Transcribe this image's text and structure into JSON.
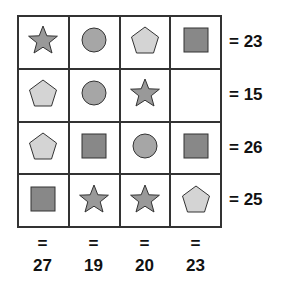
{
  "puzzle": {
    "grid": [
      [
        "star",
        "circle",
        "pentagon",
        "square"
      ],
      [
        "pentagon",
        "circle",
        "star",
        "empty"
      ],
      [
        "pentagon",
        "square",
        "circle",
        "square"
      ],
      [
        "square",
        "star",
        "star",
        "pentagon"
      ]
    ],
    "row_sums": [
      "= 23",
      "= 15",
      "= 26",
      "= 25"
    ],
    "col_equals": [
      "=",
      "=",
      "=",
      "="
    ],
    "col_sums": [
      "27",
      "19",
      "20",
      "23"
    ]
  },
  "colors": {
    "star": "#999999",
    "circle": "#a6a6a6",
    "pentagon": "#d4d4d4",
    "square": "#888888",
    "stroke": "#333333"
  }
}
